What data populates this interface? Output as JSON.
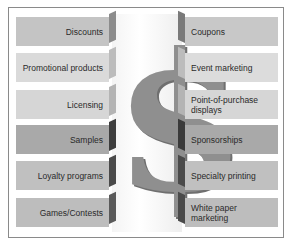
{
  "diagram": {
    "center_symbol": "$",
    "colors": {
      "light_box": "#d6d6d6",
      "mid_box": "#bdbdbd",
      "dark_box": "#a8a8a8",
      "light_side": "#9e9e9e",
      "dark_side": "#3e3e3e",
      "dollar": "#8f8f8f",
      "frame": "#8a8a8a"
    },
    "left_items": [
      {
        "label": "Discounts",
        "shade": "mid"
      },
      {
        "label": "Promotional products",
        "shade": "light"
      },
      {
        "label": "Licensing",
        "shade": "light"
      },
      {
        "label": "Samples",
        "shade": "dark"
      },
      {
        "label": "Loyalty programs",
        "shade": "mid"
      },
      {
        "label": "Games/Contests",
        "shade": "mid"
      }
    ],
    "right_items": [
      {
        "label": "Coupons",
        "shade": "mid"
      },
      {
        "label": "Event marketing",
        "shade": "light"
      },
      {
        "label": "Point-of-purchase displays",
        "shade": "light"
      },
      {
        "label": "Sponsorships",
        "shade": "dark"
      },
      {
        "label": "Specialty printing",
        "shade": "mid"
      },
      {
        "label": "White paper marketing",
        "shade": "mid"
      }
    ]
  }
}
